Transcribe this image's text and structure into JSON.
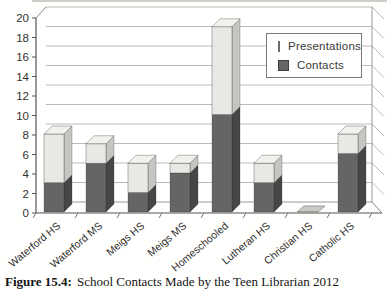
{
  "figure": {
    "caption_label": "Figure 15.4:",
    "caption_text": "School Contacts Made by the Teen Librarian 2012"
  },
  "chart_data": {
    "type": "bar",
    "stacked": true,
    "projection": "3d",
    "title": "",
    "xlabel": "",
    "ylabel": "",
    "ylim": [
      0,
      20
    ],
    "ytick_step": 2,
    "grid": true,
    "legend_position": "upper right",
    "categories": [
      "Waterford HS",
      "Waterford MS",
      "Meigs HS",
      "Meigs MS",
      "Homeschooled",
      "Lutheran HS",
      "Christian HS",
      "Catholic HS"
    ],
    "series": [
      {
        "name": "Contacts",
        "color": "#656565",
        "values": [
          3,
          5,
          2,
          4,
          10,
          3,
          0,
          6
        ]
      },
      {
        "name": "Presentations",
        "color": "#e9e8e4",
        "values": [
          5,
          2,
          3,
          1,
          9,
          2,
          0,
          2
        ]
      }
    ],
    "totals": [
      8,
      7,
      5,
      5,
      19,
      5,
      0,
      8
    ]
  },
  "legend": {
    "items": [
      {
        "label": "Presentations",
        "color": "#e9e8e4",
        "border": "#6a6a6a"
      },
      {
        "label": "Contacts",
        "color": "#656565",
        "border": "#3d3d3d"
      }
    ]
  },
  "colors": {
    "contacts_front": "#656565",
    "contacts_side": "#464646",
    "contacts_top": "#8f8f8f",
    "presentations_front": "#e9e8e4",
    "presentations_side": "#c6c5c1",
    "presentations_top": "#f2f1ee",
    "gridline": "#bbbbbb",
    "axis": "#555555",
    "text": "#333333"
  }
}
